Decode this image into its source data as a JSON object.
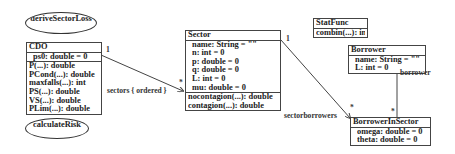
{
  "diagram": {
    "usecases": [
      {
        "id": "deriveSectorLoss",
        "label": "deriveSectorLoss"
      },
      {
        "id": "calculateRisk",
        "label": "calculateRisk"
      }
    ],
    "classes": {
      "cdo": {
        "name": "CDO",
        "attributes": [
          "ps0: double = 0"
        ],
        "operations": [
          "P(...): double",
          "PCond(...): double",
          "maxfalls(...): int",
          "PS(...): double",
          "VS(...): double",
          "PLim(...): double"
        ]
      },
      "sector": {
        "name": "Sector",
        "attributes": [
          "name: String = \"\"",
          "n: int = 0",
          "p: double = 0",
          "q: double = 0",
          "L: int = 0",
          "mu: double = 0"
        ],
        "operations": [
          "nocontagion(...): double",
          "contagion(...): double"
        ]
      },
      "statfunc": {
        "name": "StatFunc",
        "operations": [
          "combin(...): int"
        ]
      },
      "borrower": {
        "name": "Borrower",
        "attributes": [
          "name: String = \"\"",
          "L: int = 0"
        ]
      },
      "borrowerinsector": {
        "name": "BorrowerInSector",
        "attributes": [
          "omega: double = 0",
          "theta: double = 0"
        ]
      }
    },
    "associations": [
      {
        "from": "CDO",
        "to": "Sector",
        "source_mult": "1",
        "target_mult": "*",
        "role": "sectors { ordered }"
      },
      {
        "from": "Sector",
        "to": "BorrowerInSector",
        "source_mult": "1",
        "target_mult": "*",
        "role": "sectorborrowers"
      },
      {
        "from": "BorrowerInSector",
        "to": "Borrower",
        "source_mult": "*",
        "target_mult": "",
        "role": "borrower"
      }
    ],
    "colors": {
      "line": "#444444",
      "text": "#222222",
      "background": "#ffffff"
    }
  }
}
